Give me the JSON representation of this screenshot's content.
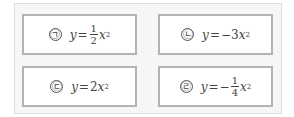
{
  "items": [
    {
      "label": "㉠",
      "lhs": "y",
      "eq": "=",
      "sign": "",
      "coef": "",
      "frac_num": "1",
      "frac_den": "2",
      "var": "x",
      "exp": "2",
      "text": "y=1/2x²"
    },
    {
      "label": "㉡",
      "lhs": "y",
      "eq": "=",
      "sign": "−",
      "coef": "3",
      "frac_num": "",
      "frac_den": "",
      "var": "x",
      "exp": "2",
      "text": "y=−3x²"
    },
    {
      "label": "㉢",
      "lhs": "y",
      "eq": "=",
      "sign": "",
      "coef": "2",
      "frac_num": "",
      "frac_den": "",
      "var": "x",
      "exp": "2",
      "text": "y=2x²"
    },
    {
      "label": "㉣",
      "lhs": "y",
      "eq": "=",
      "sign": "−",
      "coef": "",
      "frac_num": "1",
      "frac_den": "4",
      "var": "x",
      "exp": "2",
      "text": "y=−1/4x²"
    }
  ],
  "colors": {
    "border": "#b3b3b3",
    "frame_bg": "#f6f6f6",
    "text": "#444444"
  }
}
